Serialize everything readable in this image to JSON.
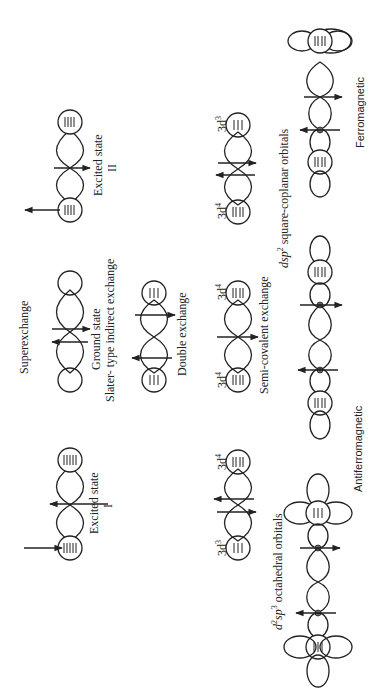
{
  "figure": {
    "orientation": "rotated 90 degrees counter-clockwise",
    "title": "Superexchange",
    "panels": [
      {
        "id": "excited-state-1",
        "label_line1": "Excited state",
        "label_line2": "I"
      },
      {
        "id": "ground-state",
        "label_line1": "Ground state",
        "label_line2": "Slater- type indirect exchange"
      },
      {
        "id": "excited-state-2",
        "label_line1": "Excited state",
        "label_line2": "II"
      },
      {
        "id": "double-exchange-left",
        "ion_left": "3d³",
        "ion_right": "3d⁴"
      },
      {
        "id": "double-exchange",
        "label": "Double  exchange"
      },
      {
        "id": "semi-covalent",
        "label": "Semi-covalent  exchange",
        "ion_left": "3d⁴",
        "ion_right": "3d⁴"
      },
      {
        "id": "double-exchange-right",
        "ion_left": "3d⁴",
        "ion_right": "3d³"
      },
      {
        "id": "antiferromagnetic",
        "orbital_label": "d²sp³ octahedral orbitals",
        "label": "Antiferromagnetic"
      },
      {
        "id": "ferromagnetic",
        "orbital_label": "dsp² square-coplanar orbitals",
        "label": "Ferromagnetic"
      }
    ]
  },
  "labels": {
    "superexchange": "Superexchange",
    "excited_state": "Excited state",
    "roman_1": "I",
    "roman_2": "II",
    "ground_state": "Ground state",
    "slater": "Slater- type indirect exchange",
    "double_exchange": "Double  exchange",
    "semi_covalent": "Semi-covalent  exchange",
    "d3": "3d",
    "d4": "3d",
    "sup3": "3",
    "sup4": "4",
    "octahedral": "octahedral orbitals",
    "octahedral_prefix_d": "d",
    "octahedral_prefix_sp": "sp",
    "square_prefix": "dsp",
    "square": "square-coplanar orbitals",
    "antiferromagnetic": "Antiferromagnetic",
    "ferromagnetic": "Ferromagnetic"
  }
}
